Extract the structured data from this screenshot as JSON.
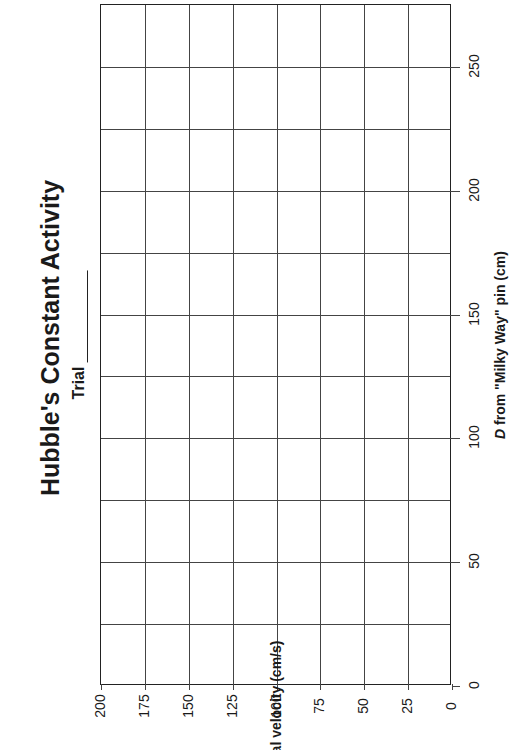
{
  "header": {
    "title": "Hubble's Constant Activity",
    "trial_label": "Trial"
  },
  "chart_data": {
    "type": "scatter",
    "title": "Hubble's Constant Activity",
    "subtitle": "Trial ____",
    "orientation": "rotated 90° counter-clockwise (blank graph worksheet)",
    "xlabel": "D from \"Milky Way\" pin (cm)",
    "xlabel_italic_part": "D",
    "xlabel_rest": " from \"Milky Way\" pin (cm)",
    "ylabel": "Recessional velocity (cm/s)",
    "xlim": [
      0,
      275
    ],
    "ylim": [
      0,
      200
    ],
    "x_ticks": [
      0,
      50,
      100,
      150,
      200,
      250
    ],
    "x_gridlines": [
      0,
      25,
      50,
      75,
      100,
      125,
      150,
      175,
      200,
      225,
      250,
      275
    ],
    "y_ticks": [
      200,
      175,
      150,
      125,
      100,
      75,
      50,
      25,
      0
    ],
    "grid": true,
    "series": [],
    "legend": null
  },
  "axis": {
    "x_ticks": [
      "0",
      "50",
      "100",
      "150",
      "200",
      "250"
    ],
    "y_ticks": [
      "200",
      "175",
      "150",
      "125",
      "100",
      "75",
      "50",
      "25",
      "0"
    ],
    "xlabel_italic": "D",
    "xlabel_rest": " from \"Milky Way\" pin (cm)",
    "ylabel": "Recessional velocity (cm/s)"
  }
}
